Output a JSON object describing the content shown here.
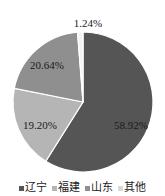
{
  "chart_data": {
    "type": "pie",
    "title": "",
    "categories": [
      "辽宁",
      "福建",
      "山东",
      "其他"
    ],
    "values": [
      58.92,
      19.2,
      20.64,
      1.24
    ],
    "labels": [
      "58.92%",
      "19.20%",
      "20.64%",
      "1.24%"
    ],
    "colors": [
      "#555555",
      "#b5b5b5",
      "#8f8f8f",
      "#f2f2f2"
    ],
    "legend_position": "bottom",
    "start_angle_deg": 0,
    "direction": "clockwise"
  },
  "legend": {
    "items": [
      {
        "label": "辽宁",
        "color": "#555555"
      },
      {
        "label": "福建",
        "color": "#b5b5b5"
      },
      {
        "label": "山东",
        "color": "#8f8f8f"
      },
      {
        "label": "其他",
        "color": "#d9d9d9"
      }
    ]
  }
}
